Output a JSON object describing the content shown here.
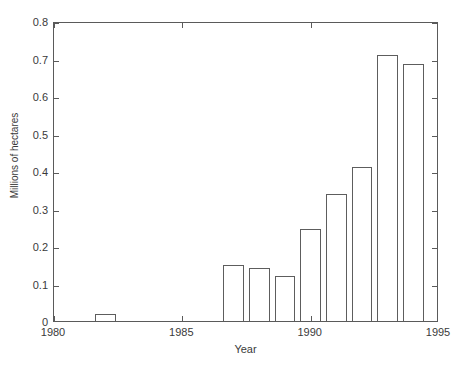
{
  "chart_data": {
    "type": "bar",
    "title": "",
    "xlabel": "Year",
    "ylabel": "Millions of hectares",
    "xlim": [
      1980,
      1995
    ],
    "ylim": [
      0,
      0.8
    ],
    "xticks": [
      1980,
      1985,
      1990,
      1995
    ],
    "xtick_labels": [
      "1980",
      "1985",
      "1990",
      "1995"
    ],
    "yticks": [
      0,
      0.1,
      0.2,
      0.3,
      0.4,
      0.5,
      0.6,
      0.7,
      0.8
    ],
    "ytick_labels": [
      "0",
      "0.1",
      "0.2",
      "0.3",
      "0.4",
      "0.5",
      "0.6",
      "0.7",
      "0.8"
    ],
    "grid": false,
    "legend": false,
    "bar_width_years": 0.8,
    "bar_fill": "#ffffff",
    "bar_edge": "#5d5d5d",
    "axis_color": "#5a5a5a",
    "categories": [
      1982,
      1987,
      1988,
      1989,
      1990,
      1991,
      1992,
      1993,
      1994
    ],
    "values": [
      0.02,
      0.15,
      0.142,
      0.12,
      0.245,
      0.34,
      0.41,
      0.71,
      0.685
    ],
    "bars": [
      {
        "year": 1982,
        "value": 0.02
      },
      {
        "year": 1987,
        "value": 0.15
      },
      {
        "year": 1988,
        "value": 0.142
      },
      {
        "year": 1989,
        "value": 0.12
      },
      {
        "year": 1990,
        "value": 0.245
      },
      {
        "year": 1991,
        "value": 0.34
      },
      {
        "year": 1992,
        "value": 0.41
      },
      {
        "year": 1993,
        "value": 0.71
      },
      {
        "year": 1994,
        "value": 0.685
      }
    ]
  }
}
